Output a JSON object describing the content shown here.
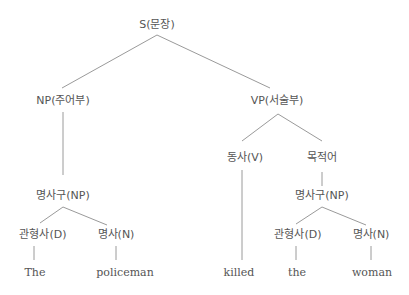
{
  "diagram": {
    "type": "syntax-tree",
    "root": "S(문장)",
    "nodes": {
      "s": "S(문장)",
      "np_subject": "NP(주어부)",
      "vp_predicate": "VP(서술부)",
      "np_left": "명사구(NP)",
      "det_left": "관형사(D)",
      "noun_left": "명사(N)",
      "verb": "동사(V)",
      "object": "목적어",
      "np_right": "명사구(NP)",
      "det_right": "관형사(D)",
      "noun_right": "명사(N)"
    },
    "leaves": {
      "the_upper": "The",
      "policeman": "policeman",
      "killed": "killed",
      "the_lower": "the",
      "woman": "woman"
    },
    "edges": [
      [
        "S(문장)",
        "NP(주어부)"
      ],
      [
        "S(문장)",
        "VP(서술부)"
      ],
      [
        "NP(주어부)",
        "명사구(NP)"
      ],
      [
        "명사구(NP)",
        "관형사(D)"
      ],
      [
        "명사구(NP)",
        "명사(N)"
      ],
      [
        "관형사(D)",
        "The"
      ],
      [
        "명사(N)",
        "policeman"
      ],
      [
        "VP(서술부)",
        "동사(V)"
      ],
      [
        "VP(서술부)",
        "목적어"
      ],
      [
        "동사(V)",
        "killed"
      ],
      [
        "목적어",
        "명사구(NP)"
      ],
      [
        "명사구(NP)",
        "관형사(D)"
      ],
      [
        "명사구(NP)",
        "명사(N)"
      ],
      [
        "관형사(D)",
        "the"
      ],
      [
        "명사(N)",
        "woman"
      ]
    ],
    "colors": {
      "line": "#9a9a9a",
      "text": "#555555",
      "background": "#ffffff"
    }
  }
}
